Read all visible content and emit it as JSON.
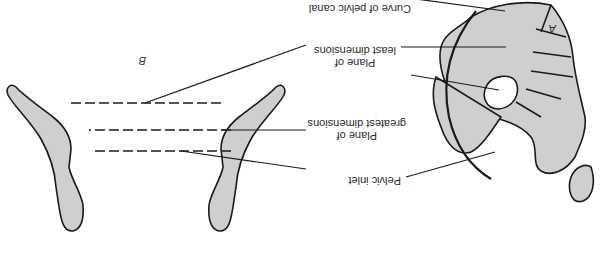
{
  "diagram": {
    "orientation": "rotated 180 degrees",
    "colors": {
      "bone_fill": "#cfcfcf",
      "stroke": "#1a1a1a",
      "background": "#ffffff"
    },
    "figures": [
      {
        "id": "A",
        "label": "A",
        "description": "Sagittal view of pelvis with sacrum and coccyx"
      },
      {
        "id": "B",
        "label": "B",
        "description": "Frontal section view showing pelvic planes"
      }
    ],
    "labels": {
      "curve": "Curve of pelvic canal",
      "least_line1": "Plane of",
      "least_line2": "least dimensions",
      "greatest_line1": "Plane of",
      "greatest_line2": "greatest dimensions",
      "inlet": "Pelvic inlet"
    }
  }
}
